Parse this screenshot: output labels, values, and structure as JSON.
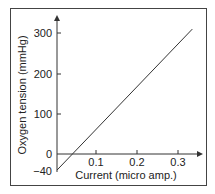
{
  "chart_data": {
    "type": "line",
    "title": "",
    "xlabel": "Current (micro amp.)",
    "ylabel": "Oxygen tension (mmHg)",
    "x_ticks": [
      "0.1",
      "0.2",
      "0.3"
    ],
    "y_ticks": [
      "300",
      "200",
      "100",
      "0",
      "−40"
    ],
    "xlim": [
      0,
      0.35
    ],
    "ylim": [
      -40,
      330
    ],
    "grid": false,
    "legend": null,
    "series": [
      {
        "name": "calibration",
        "x": [
          0,
          0.33
        ],
        "y": [
          -40,
          310
        ]
      }
    ]
  }
}
